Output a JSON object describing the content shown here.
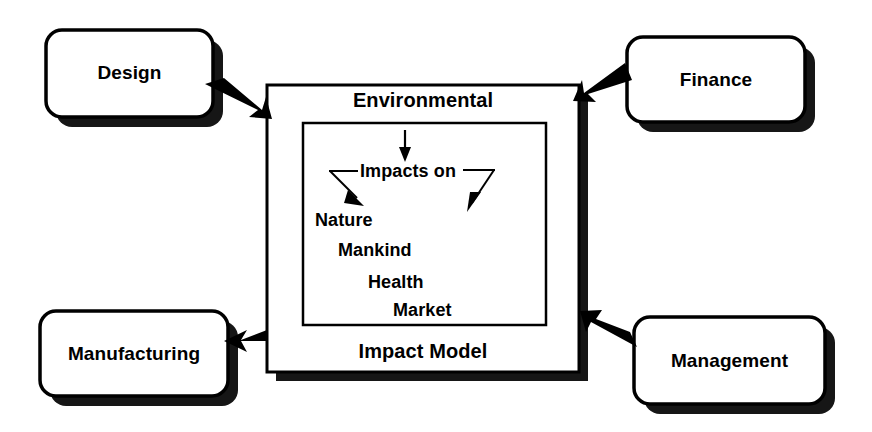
{
  "diagram": {
    "title": "Environmental Impact Model",
    "background_color": "#ffffff",
    "ink_color": "#000000",
    "shadow_color": "#1a1a1a",
    "outer_nodes": [
      {
        "id": "design",
        "label": "Design",
        "position": "top-left"
      },
      {
        "id": "finance",
        "label": "Finance",
        "position": "top-right"
      },
      {
        "id": "manufacturing",
        "label": "Manufacturing",
        "position": "bottom-left"
      },
      {
        "id": "management",
        "label": "Management",
        "position": "bottom-right"
      }
    ],
    "center": {
      "header": "Environmental",
      "footer": "Impact Model",
      "inner": {
        "flow_label": "Impacts on",
        "items": [
          {
            "label": "Nature",
            "indent": 0
          },
          {
            "label": "Mankind",
            "indent": 1
          },
          {
            "label": "Health",
            "indent": 2
          },
          {
            "label": "Market",
            "indent": 3
          }
        ]
      }
    },
    "connectors": [
      {
        "id": "design-to-center",
        "from": "design",
        "to": "center",
        "direction": "down-right"
      },
      {
        "id": "finance-to-center",
        "from": "finance",
        "to": "center",
        "direction": "down-left"
      },
      {
        "id": "center-to-manufacturing",
        "from": "center",
        "to": "manufacturing",
        "direction": "left"
      },
      {
        "id": "management-to-center",
        "from": "management",
        "to": "center",
        "direction": "up-left"
      }
    ],
    "inner_arrows": [
      {
        "id": "top-down-arrow",
        "direction": "down"
      },
      {
        "id": "branch-left-arrow",
        "direction": "down-left"
      },
      {
        "id": "branch-right-arrow",
        "direction": "down-right"
      }
    ]
  }
}
